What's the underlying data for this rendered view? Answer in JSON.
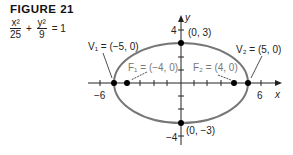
{
  "figure": {
    "title": "FIGURE 21",
    "equation": {
      "term1_num": "x²",
      "term1_den": "25",
      "plus": "+",
      "term2_num": "y²",
      "term2_den": "9",
      "rhs": "= 1"
    }
  },
  "axes": {
    "x_label": "x",
    "y_label": "y",
    "x_ticks": {
      "min": "−6",
      "max": "6"
    },
    "y_ticks": {
      "max": "4",
      "min": "−4"
    }
  },
  "points": {
    "v1": "V₁ = (−5, 0)",
    "v2": "V₂ = (5, 0)",
    "f1": "F₁ = (−4, 0)",
    "f2": "F₂ = (4, 0)",
    "top": "(0, 3)",
    "bottom": "(0, −3)"
  },
  "colors": {
    "ellipse": "#777777",
    "axis": "#222222",
    "point": "#000000"
  }
}
